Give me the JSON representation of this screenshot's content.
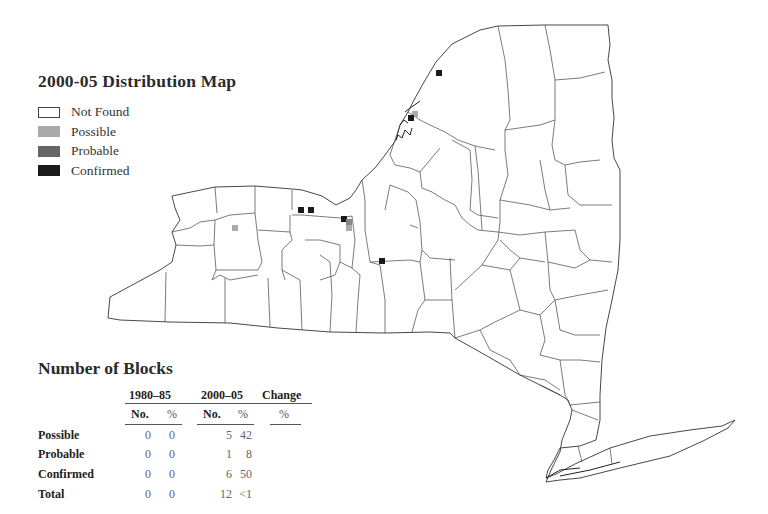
{
  "map": {
    "title": "2000-05 Distribution Map",
    "legend": [
      {
        "label": "Not Found",
        "color": "#ffffff"
      },
      {
        "label": "Possible",
        "color": "#aaaaaa"
      },
      {
        "label": "Probable",
        "color": "#666666"
      },
      {
        "label": "Confirmed",
        "color": "#1a1a1a"
      }
    ],
    "region": "New York State (county outlines)",
    "points": [
      {
        "status": "Confirmed",
        "x": 439,
        "y": 73
      },
      {
        "status": "Possible",
        "x": 415,
        "y": 114
      },
      {
        "status": "Confirmed",
        "x": 411,
        "y": 118
      },
      {
        "status": "Possible",
        "x": 235,
        "y": 228
      },
      {
        "status": "Confirmed",
        "x": 301,
        "y": 210
      },
      {
        "status": "Confirmed",
        "x": 311,
        "y": 210
      },
      {
        "status": "Confirmed",
        "x": 344,
        "y": 219
      },
      {
        "status": "Probable",
        "x": 349,
        "y": 222
      },
      {
        "status": "Possible",
        "x": 349,
        "y": 227
      },
      {
        "status": "Confirmed",
        "x": 382,
        "y": 261
      }
    ]
  },
  "blocks": {
    "title": "Number of Blocks",
    "periods": [
      "1980–85",
      "2000–05",
      "Change"
    ],
    "subheaders": [
      "No.",
      "%",
      "No.",
      "%",
      "%"
    ],
    "rows": [
      {
        "label": "Possible",
        "no_1980": "0",
        "pct_1980": "0",
        "no_2000": "5",
        "pct_2000": "42",
        "change": ""
      },
      {
        "label": "Probable",
        "no_1980": "0",
        "pct_1980": "0",
        "no_2000": "1",
        "pct_2000": "8",
        "change": ""
      },
      {
        "label": "Confirmed",
        "no_1980": "0",
        "pct_1980": "0",
        "no_2000": "6",
        "pct_2000": "50",
        "change": ""
      },
      {
        "label": "Total",
        "no_1980": "0",
        "pct_1980": "0",
        "no_2000": "12",
        "pct_2000": "<1",
        "change": ""
      }
    ]
  }
}
